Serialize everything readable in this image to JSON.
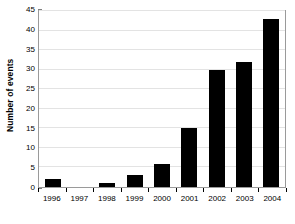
{
  "chart_data": {
    "type": "bar",
    "title": "",
    "subtitle": "",
    "xlabel": "",
    "ylabel": "Number of events",
    "categories": [
      "1996",
      "1997",
      "1998",
      "1999",
      "2000",
      "2001",
      "2002",
      "2003",
      "2004"
    ],
    "values": [
      2,
      0,
      1,
      3,
      6,
      15,
      30,
      32,
      43
    ],
    "series": [
      {
        "name": "Number of events",
        "values": [
          2,
          0,
          1,
          3,
          6,
          15,
          30,
          32,
          43
        ]
      }
    ],
    "ylim": [
      0,
      45
    ],
    "ytick_values": [
      0,
      5,
      10,
      15,
      20,
      25,
      30,
      35,
      40,
      45
    ],
    "ytick_labels": [
      "0",
      "5",
      "10",
      "15",
      "20",
      "25",
      "30",
      "35",
      "40",
      "45"
    ],
    "grid": "horizontal",
    "legend": "none",
    "bar_color": "#000000",
    "gridline_color": "#e3e3e3",
    "axis_color": "#9a9a9a",
    "background_color": "#ffffff",
    "annotations": []
  }
}
